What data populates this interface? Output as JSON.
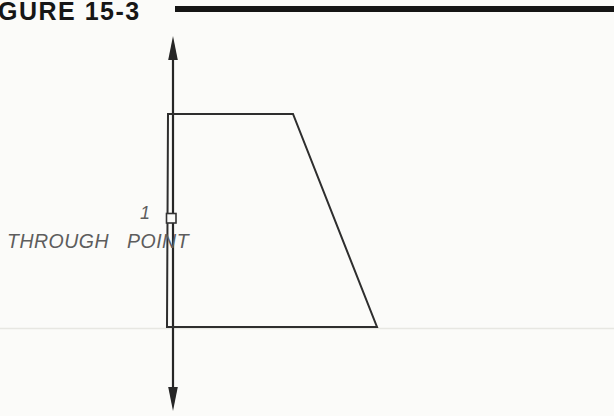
{
  "figure": {
    "title": "GURE 15-3",
    "point_label": "1",
    "through_point_label": "THROUGH POINT"
  },
  "colors": {
    "ink": "#2e2e2e",
    "title_black": "#161616",
    "rule_black": "#151515",
    "label_gray": "#5d5d5d",
    "faint_artifact_line": "#e7e7e2",
    "paper": "#fbfbf9"
  }
}
